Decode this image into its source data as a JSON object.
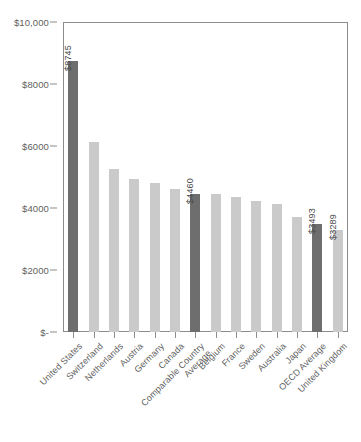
{
  "chart_data": {
    "type": "bar",
    "title": "",
    "subtitle": "",
    "xlabel": "",
    "ylabel": "",
    "ylim": [
      0,
      10000
    ],
    "grid": false,
    "legend": null,
    "y_ticks": [
      {
        "value": 10000,
        "label": "$10,000"
      },
      {
        "value": 8000,
        "label": "$8000"
      },
      {
        "value": 6000,
        "label": "$6000"
      },
      {
        "value": 4000,
        "label": "$4000"
      },
      {
        "value": 2000,
        "label": "$2000"
      },
      {
        "value": 0,
        "label": "$-"
      }
    ],
    "categories": [
      "United States",
      "Switzerland",
      "Netherlands",
      "Austria",
      "Germany",
      "Canada",
      "Comparable Country Average",
      "Belgium",
      "France",
      "Sweden",
      "Australia",
      "Japan",
      "OECD Average",
      "United Kingdom"
    ],
    "values": [
      8745,
      6130,
      5250,
      4940,
      4820,
      4620,
      4460,
      4450,
      4360,
      4230,
      4130,
      3700,
      3493,
      3289
    ],
    "data_labels": [
      {
        "index": 0,
        "text": "$8745"
      },
      {
        "index": 6,
        "text": "$4460"
      },
      {
        "index": 12,
        "text": "$3493"
      },
      {
        "index": 13,
        "text": "$3289"
      }
    ],
    "highlighted": [
      0,
      6,
      12
    ],
    "colors": {
      "bar": "#cacaca",
      "bar_highlight": "#6e6e6e",
      "axis": "#8c8c8c",
      "text": "#5f5f5f",
      "background": "#ffffff"
    }
  }
}
